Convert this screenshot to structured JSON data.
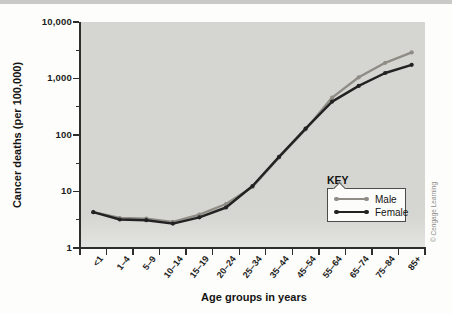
{
  "credit": "© Cengage Learning",
  "chart_data": {
    "type": "line",
    "title": "",
    "xlabel": "Age groups in years",
    "ylabel": "Cancer deaths (per 100,000)",
    "y_scale": "log",
    "ylim": [
      1,
      10000
    ],
    "grid": false,
    "y_ticks": [
      {
        "label": "10,000",
        "value": 10000
      },
      {
        "label": "1,000",
        "value": 1000
      },
      {
        "label": "100",
        "value": 100
      },
      {
        "label": "10",
        "value": 10
      },
      {
        "label": "1",
        "value": 1
      }
    ],
    "categories": [
      "<1",
      "1–4",
      "5–9",
      "10–14",
      "15–19",
      "20–24",
      "25–34",
      "35–44",
      "45–54",
      "55–64",
      "65–74",
      "75–84",
      "85+"
    ],
    "series": [
      {
        "name": "Male",
        "color": "#8f8c86",
        "values": [
          4.3,
          3.4,
          3.3,
          2.9,
          3.9,
          6.0,
          12,
          40,
          125,
          460,
          1050,
          1900,
          2900
        ]
      },
      {
        "name": "Female",
        "color": "#222222",
        "values": [
          4.3,
          3.2,
          3.1,
          2.7,
          3.5,
          5.2,
          12.5,
          41,
          130,
          390,
          740,
          1250,
          1750
        ]
      }
    ],
    "legend": {
      "title": "KEY",
      "position": "inside bottom-right"
    }
  },
  "colors": {
    "plot_background": "#d5d6d2",
    "axis": "#2e2e2c",
    "male_line": "#8f8c86",
    "female_line": "#222222"
  }
}
